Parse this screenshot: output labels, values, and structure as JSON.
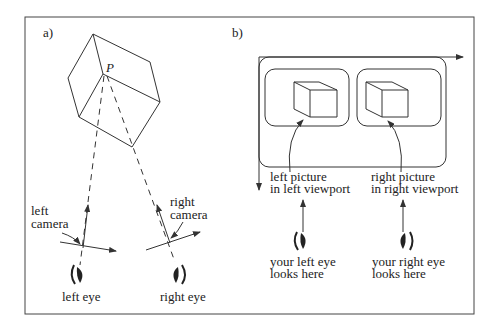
{
  "panel_a": {
    "label": "a)",
    "point_label": "P",
    "left_camera_line1": "left",
    "left_camera_line2": "camera",
    "right_camera_line1": "right",
    "right_camera_line2": "camera",
    "left_eye": "left eye",
    "right_eye": "right eye"
  },
  "panel_b": {
    "label": "b)",
    "left_picture_line1": "left picture",
    "left_picture_line2": "in left viewport",
    "right_picture_line1": "right picture",
    "right_picture_line2": "in right viewport",
    "left_eye_line1": "your left eye",
    "left_eye_line2": "looks here",
    "right_eye_line1": "your right eye",
    "right_eye_line2": "looks here"
  },
  "colors": {
    "stroke": "#333333",
    "text": "#222222",
    "background": "#ffffff"
  }
}
